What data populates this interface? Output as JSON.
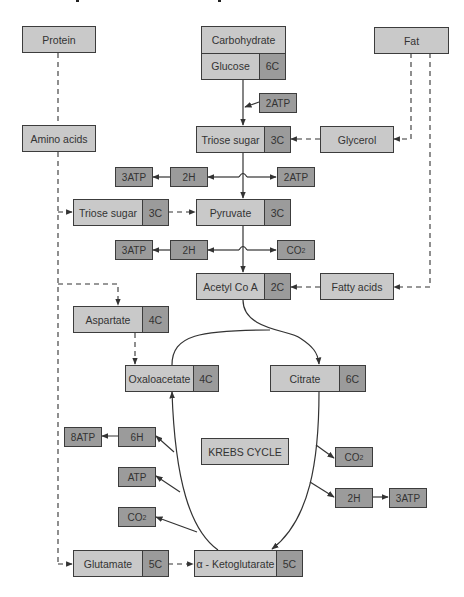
{
  "diagram": {
    "title_fragments_visible": true,
    "colors": {
      "light_fill": "#c9c9c9",
      "dark_fill": "#9b9b9b",
      "border": "#3c3c3c",
      "line": "#333333",
      "background": "#ffffff"
    },
    "sources": {
      "protein": "Protein",
      "carbohydrate": "Carbohydrate",
      "fat": "Fat"
    },
    "nodes": {
      "glucose": {
        "label": "Glucose",
        "carbons": "6C"
      },
      "amino_acids": {
        "label": "Amino acids"
      },
      "triose_sugar_main": {
        "label": "Triose sugar",
        "carbons": "3C"
      },
      "glycerol": {
        "label": "Glycerol"
      },
      "triose_sugar_left": {
        "label": "Triose sugar",
        "carbons": "3C"
      },
      "pyruvate": {
        "label": "Pyruvate",
        "carbons": "3C"
      },
      "acetyl_coa": {
        "label": "Acetyl Co A",
        "carbons": "2C"
      },
      "fatty_acids": {
        "label": "Fatty acids"
      },
      "aspartate": {
        "label": "Aspartate",
        "carbons": "4C"
      },
      "oxaloacetate": {
        "label": "Oxaloacetate",
        "carbons": "4C"
      },
      "citrate": {
        "label": "Citrate",
        "carbons": "6C"
      },
      "krebs_cycle": {
        "label": "KREBS CYCLE"
      },
      "glutamate": {
        "label": "Glutamate",
        "carbons": "5C"
      },
      "alpha_ketoglutarate": {
        "label": "α - Ketoglutarate",
        "carbons": "5C"
      }
    },
    "products": {
      "glycolysis_input_atp": "2ATP",
      "triose_row": {
        "left_atp": "3ATP",
        "hydrogen": "2H",
        "right_atp": "2ATP"
      },
      "pyruvate_row": {
        "left_atp": "3ATP",
        "hydrogen": "2H",
        "co2": "CO",
        "co2_sub": "2"
      },
      "krebs_left": {
        "atp8": "8ATP",
        "h6": "6H",
        "atp": "ATP",
        "co2": "CO",
        "co2_sub": "2"
      },
      "krebs_right": {
        "co2": "CO",
        "co2_sub": "2",
        "hydrogen": "2H",
        "atp3": "3ATP"
      }
    }
  }
}
